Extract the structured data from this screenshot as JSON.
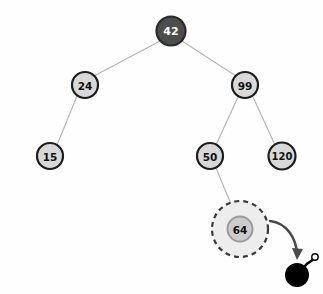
{
  "figure": {
    "background_color": "#fefefe",
    "width": 323,
    "height": 294
  },
  "style": {
    "edge_color": "#b3b3b3",
    "edge_width": 1.1,
    "node_fill": "#d8d8d8",
    "node_stroke": "#1c1c1c",
    "node_stroke_width": 2.2,
    "node_text_color": "#111111",
    "root_fill": "#4d4d4d",
    "root_stroke": "#2b2b2b",
    "root_text_color": "#ffffff",
    "highlight_fill": "#ededed",
    "highlight_stroke": "#3a3a3a",
    "highlight_node_fill": "#cccccc",
    "arrow_color": "#4a4a4a",
    "bomb_color": "#000000",
    "spark_color": "#ffffff"
  },
  "tree": {
    "nodes": [
      {
        "id": "n42",
        "label": "42",
        "cx": 171,
        "cy": 31,
        "r": 14.5,
        "variant": "root",
        "font_size": 11
      },
      {
        "id": "n24",
        "label": "24",
        "cx": 85,
        "cy": 85,
        "r": 13,
        "variant": "normal",
        "font_size": 10.5
      },
      {
        "id": "n99",
        "label": "99",
        "cx": 245,
        "cy": 85,
        "r": 13,
        "variant": "normal",
        "font_size": 10.5
      },
      {
        "id": "n15",
        "label": "15",
        "cx": 50,
        "cy": 156,
        "r": 13,
        "variant": "normal",
        "font_size": 10.5
      },
      {
        "id": "n50",
        "label": "50",
        "cx": 210,
        "cy": 156,
        "r": 13,
        "variant": "normal",
        "font_size": 10.5
      },
      {
        "id": "n120",
        "label": "120",
        "cx": 282,
        "cy": 156,
        "r": 13.5,
        "variant": "normal",
        "font_size": 10
      },
      {
        "id": "n64",
        "label": "64",
        "cx": 240,
        "cy": 229,
        "r": 12.5,
        "variant": "highlight",
        "font_size": 10.5
      }
    ],
    "edges": [
      {
        "from": "n42",
        "to": "n24",
        "x1": 160,
        "y1": 41,
        "x2": 94,
        "y2": 76
      },
      {
        "from": "n42",
        "to": "n99",
        "x1": 182,
        "y1": 41,
        "x2": 236,
        "y2": 76
      },
      {
        "from": "n24",
        "to": "n15",
        "x1": 77,
        "y1": 96,
        "x2": 57,
        "y2": 145
      },
      {
        "from": "n99",
        "to": "n50",
        "x1": 238,
        "y1": 97,
        "x2": 216,
        "y2": 145
      },
      {
        "from": "n99",
        "to": "n120",
        "x1": 253,
        "y1": 97,
        "x2": 275,
        "y2": 145
      },
      {
        "from": "n50",
        "to": "n64",
        "x1": 216,
        "y1": 168,
        "x2": 236,
        "y2": 216
      }
    ]
  },
  "highlight": {
    "node_id": "n64",
    "cx": 240,
    "cy": 229,
    "outer_r": 28,
    "dash_pattern": "5,4",
    "dash_width": 2.2
  },
  "annotation": {
    "arrow": {
      "name": "delete-arrow",
      "path": "M 270 221 C 287 223 296 238 297 254",
      "head": "M 292 248 L 297 260 L 303 249 Z"
    },
    "bomb": {
      "name": "bomb-icon",
      "body_cx": 297,
      "body_cy": 275,
      "body_r": 12,
      "fuse_path": "M 305 266 C 309 261 312 262 313 259",
      "fuse_width": 2.4,
      "spark_cx": 315,
      "spark_cy": 257,
      "spark_r": 3.2,
      "spark_inner_r": 1.6
    }
  }
}
